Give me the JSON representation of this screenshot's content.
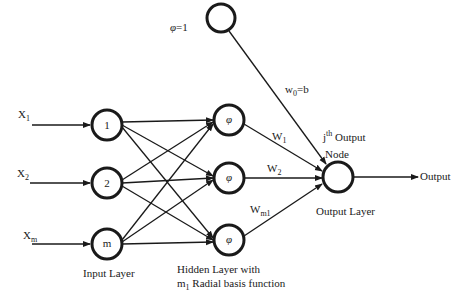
{
  "bias": {
    "label_symbol": "φ",
    "label_value": "=1",
    "weight_label_main": "w",
    "weight_label_sub": "0",
    "weight_label_rest": "=b"
  },
  "inputs": [
    {
      "var": "X",
      "sub": "1",
      "node_label": "1"
    },
    {
      "var": "X",
      "sub": "2",
      "node_label": "2"
    },
    {
      "var": "X",
      "sub": "m",
      "node_label": "m"
    }
  ],
  "hidden": [
    {
      "node_label": "φ",
      "weight_main": "W",
      "weight_sub": "1"
    },
    {
      "node_label": "φ",
      "weight_main": "W",
      "weight_sub": "2"
    },
    {
      "node_label": "φ",
      "weight_main": "W",
      "weight_sub": "m1"
    }
  ],
  "output_node": {
    "j": "j",
    "th": "th",
    "line1_rest": " Output",
    "line2": "Node"
  },
  "output_arrow_label": "Output",
  "layer_labels": {
    "input": "Input Layer",
    "hidden_line1": "Hidden Layer with",
    "hidden_line2_m": "m",
    "hidden_line2_sub": "1",
    "hidden_line2_rest": " Radial basis function",
    "output": "Output Layer"
  }
}
